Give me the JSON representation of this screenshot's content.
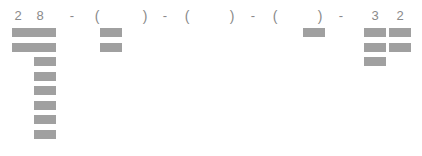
{
  "diagram": {
    "width": 422,
    "height": 156,
    "background_color": "#ffffff",
    "bar_color": "#a0a0a0",
    "text_color": "#8a8a8a",
    "header_line": "2 8 - ( ) - ( ) - ( ) - 3 2"
  },
  "header_tokens": [
    {
      "text": "2",
      "kind": "digit",
      "x": 11,
      "width": 14
    },
    {
      "text": "8",
      "kind": "digit",
      "x": 33,
      "width": 14
    },
    {
      "text": "-",
      "kind": "dash",
      "x": 65,
      "width": 14
    },
    {
      "text": "(",
      "kind": "paren",
      "x": 91,
      "width": 12
    },
    {
      "text": ")",
      "kind": "paren",
      "x": 139,
      "width": 12
    },
    {
      "text": "-",
      "kind": "dash",
      "x": 158,
      "width": 14
    },
    {
      "text": "(",
      "kind": "paren",
      "x": 181,
      "width": 12
    },
    {
      "text": ")",
      "kind": "paren",
      "x": 226,
      "width": 12
    },
    {
      "text": "-",
      "kind": "dash",
      "x": 246,
      "width": 14
    },
    {
      "text": "(",
      "kind": "paren",
      "x": 269,
      "width": 12
    },
    {
      "text": ")",
      "kind": "paren",
      "x": 314,
      "width": 12
    },
    {
      "text": "-",
      "kind": "dash",
      "x": 334,
      "width": 14
    },
    {
      "text": "3",
      "kind": "digit",
      "x": 368,
      "width": 14
    },
    {
      "text": "2",
      "kind": "digit",
      "x": 393,
      "width": 14
    }
  ],
  "bar_columns": [
    {
      "name": "column-2-left",
      "label": "2",
      "x": 12,
      "y": 28,
      "width": 22,
      "count": 2,
      "pitch": 14.5
    },
    {
      "name": "column-8",
      "label": "8",
      "x": 34,
      "y": 28,
      "width": 22,
      "count": 8,
      "pitch": 14.5
    },
    {
      "name": "column-group-1",
      "label": "(",
      "x": 100,
      "y": 28,
      "width": 22,
      "count": 2,
      "pitch": 14.5
    },
    {
      "name": "column-group-2",
      "label": "(",
      "x": 190,
      "y": 28,
      "width": 22,
      "count": 0,
      "pitch": 14.5
    },
    {
      "name": "column-group-3",
      "label": "(",
      "x": 303,
      "y": 28,
      "width": 22,
      "count": 1,
      "pitch": 14.5
    },
    {
      "name": "column-3-right",
      "label": "3",
      "x": 364,
      "y": 28,
      "width": 22,
      "count": 3,
      "pitch": 14.5
    },
    {
      "name": "column-2-right",
      "label": "2",
      "x": 389,
      "y": 28,
      "width": 22,
      "count": 2,
      "pitch": 14.5
    }
  ],
  "chart_data": {
    "type": "bar",
    "title": "",
    "xlabel": "",
    "ylabel": "",
    "categories": [
      "2",
      "8",
      "( )",
      "( )",
      "( )",
      "3",
      "2"
    ],
    "values": [
      2,
      8,
      2,
      0,
      1,
      3,
      2
    ],
    "note": "Each value is the number of stacked gray bands rendered under the header token."
  }
}
